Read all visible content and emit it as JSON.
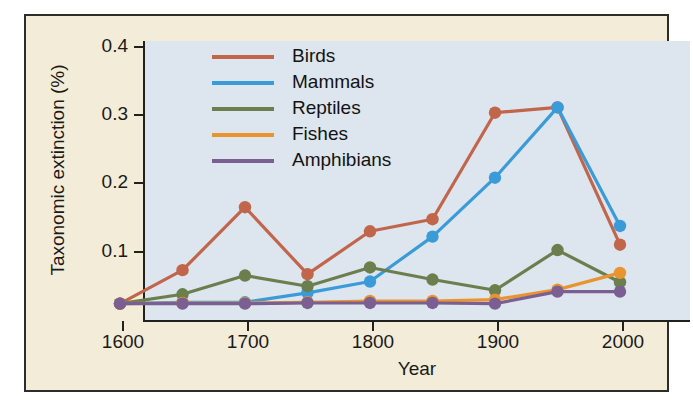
{
  "chart_data": {
    "type": "line",
    "title": "",
    "xlabel": "Year",
    "ylabel": "Taxonomic extinction (%)",
    "xlim": [
      1600,
      2000
    ],
    "ylim": [
      0,
      0.42
    ],
    "x": [
      1600,
      1650,
      1700,
      1750,
      1800,
      1850,
      1900,
      1950,
      2000
    ],
    "xticks": [
      1600,
      1700,
      1800,
      1900,
      2000
    ],
    "xtick_labels": [
      "1600",
      "1700",
      "1800",
      "1900",
      "2000"
    ],
    "yticks": [
      0.1,
      0.2,
      0.3,
      0.4
    ],
    "ytick_labels": [
      "0.1",
      "0.2",
      "0.3",
      "0.4"
    ],
    "grid": false,
    "legend_position": "upper-center",
    "markers": "circle",
    "series": [
      {
        "name": "Birds",
        "color": "#c1654b",
        "values": [
          0.002,
          0.052,
          0.146,
          0.046,
          0.11,
          0.128,
          0.287,
          0.295,
          0.09
        ]
      },
      {
        "name": "Mammals",
        "color": "#3b9bd8",
        "values": [
          0.002,
          0.004,
          0.004,
          0.018,
          0.035,
          0.102,
          0.19,
          0.295,
          0.118
        ]
      },
      {
        "name": "Reptiles",
        "color": "#6b7f4e",
        "values": [
          0.002,
          0.016,
          0.044,
          0.028,
          0.056,
          0.038,
          0.022,
          0.082,
          0.034
        ]
      },
      {
        "name": "Fishes",
        "color": "#e9952f",
        "values": [
          0.002,
          0.003,
          0.003,
          0.004,
          0.006,
          0.006,
          0.008,
          0.023,
          0.048
        ]
      },
      {
        "name": "Amphibians",
        "color": "#7b5f92",
        "values": [
          0.002,
          0.002,
          0.002,
          0.003,
          0.003,
          0.003,
          0.002,
          0.02,
          0.02
        ]
      }
    ]
  },
  "axes": {
    "ylabel": "Taxonomic extinction (%)",
    "xlabel": "Year",
    "ytick_labels": [
      "0.4",
      "0.3",
      "0.2",
      "0.1"
    ],
    "xtick_labels": [
      "1600",
      "1700",
      "1800",
      "1900",
      "2000"
    ]
  },
  "legend": {
    "items": [
      {
        "label": "Birds",
        "color": "#c1654b"
      },
      {
        "label": "Mammals",
        "color": "#3b9bd8"
      },
      {
        "label": "Reptiles",
        "color": "#6b7f4e"
      },
      {
        "label": "Fishes",
        "color": "#e9952f"
      },
      {
        "label": "Amphibians",
        "color": "#7b5f92"
      }
    ]
  },
  "colors": {
    "panel_background": "#f2ecd8",
    "plot_background": "#dde5ee",
    "frame": "#2e2c28",
    "text": "#1b1a18"
  }
}
